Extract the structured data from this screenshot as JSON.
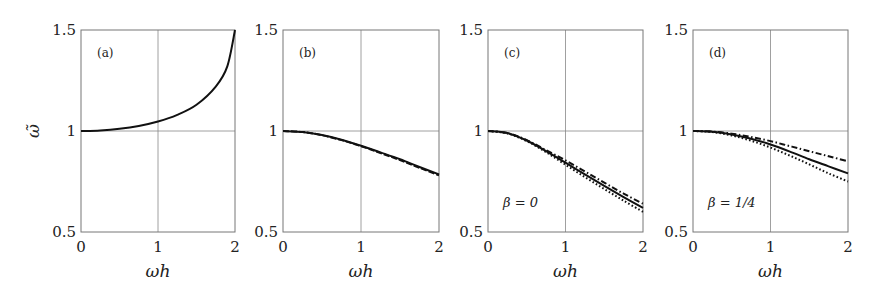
{
  "chart_data": [
    {
      "type": "line",
      "panel_label": "(a)",
      "xlabel": "ωh",
      "ylabel": "ω̃",
      "xlim": [
        0,
        2
      ],
      "ylim": [
        0.5,
        1.5
      ],
      "xticks": [
        "0",
        "1",
        "2"
      ],
      "yticks": [
        "0.5",
        "1",
        "1.5"
      ],
      "grid": true,
      "annotation": "",
      "x": [
        0,
        0.25,
        0.5,
        0.75,
        1.0,
        1.25,
        1.5,
        1.75,
        1.9,
        2.0
      ],
      "series": [
        {
          "name": "solid",
          "style": "solid",
          "values": [
            1.0,
            1.003,
            1.011,
            1.025,
            1.047,
            1.08,
            1.13,
            1.22,
            1.32,
            1.5
          ]
        }
      ]
    },
    {
      "type": "line",
      "panel_label": "(b)",
      "xlabel": "ωh",
      "ylabel": "",
      "xlim": [
        0,
        2
      ],
      "ylim": [
        0.5,
        1.5
      ],
      "xticks": [
        "0",
        "1",
        "2"
      ],
      "yticks": [
        "0.5",
        "1",
        "1.5"
      ],
      "grid": true,
      "annotation": "",
      "x": [
        0,
        0.25,
        0.5,
        0.75,
        1.0,
        1.25,
        1.5,
        1.75,
        2.0
      ],
      "series": [
        {
          "name": "solid",
          "style": "solid",
          "values": [
            1.0,
            0.995,
            0.98,
            0.957,
            0.927,
            0.894,
            0.86,
            0.822,
            0.785
          ]
        },
        {
          "name": "dashed",
          "style": "dashed",
          "values": [
            1.0,
            0.995,
            0.979,
            0.955,
            0.925,
            0.891,
            0.856,
            0.818,
            0.78
          ]
        }
      ]
    },
    {
      "type": "line",
      "panel_label": "(c)",
      "xlabel": "ωh",
      "ylabel": "",
      "xlim": [
        0,
        2
      ],
      "ylim": [
        0.5,
        1.5
      ],
      "xticks": [
        "0",
        "1",
        "2"
      ],
      "yticks": [
        "0.5",
        "1",
        "1.5"
      ],
      "grid": true,
      "annotation": "β = 0",
      "x": [
        0,
        0.25,
        0.5,
        0.75,
        1.0,
        1.25,
        1.5,
        1.75,
        2.0
      ],
      "series": [
        {
          "name": "dash-dot",
          "style": "dashdot",
          "values": [
            1.0,
            0.99,
            0.955,
            0.905,
            0.855,
            0.8,
            0.745,
            0.69,
            0.64
          ]
        },
        {
          "name": "solid",
          "style": "solid",
          "values": [
            1.0,
            0.99,
            0.953,
            0.9,
            0.843,
            0.785,
            0.728,
            0.673,
            0.62
          ]
        },
        {
          "name": "dotted",
          "style": "dotted",
          "values": [
            1.0,
            0.988,
            0.95,
            0.895,
            0.833,
            0.772,
            0.713,
            0.655,
            0.6
          ]
        }
      ]
    },
    {
      "type": "line",
      "panel_label": "(d)",
      "xlabel": "ωh",
      "ylabel": "",
      "xlim": [
        0,
        2
      ],
      "ylim": [
        0.5,
        1.5
      ],
      "xticks": [
        "0",
        "1",
        "2"
      ],
      "yticks": [
        "0.5",
        "1",
        "1.5"
      ],
      "grid": true,
      "annotation": "β = 1/4",
      "x": [
        0,
        0.25,
        0.5,
        0.75,
        1.0,
        1.25,
        1.5,
        1.75,
        2.0
      ],
      "series": [
        {
          "name": "dash-dot",
          "style": "dashdot",
          "values": [
            1.0,
            0.997,
            0.987,
            0.97,
            0.95,
            0.925,
            0.9,
            0.875,
            0.85
          ]
        },
        {
          "name": "solid",
          "style": "solid",
          "values": [
            1.0,
            0.996,
            0.983,
            0.962,
            0.933,
            0.898,
            0.86,
            0.825,
            0.79
          ]
        },
        {
          "name": "dotted",
          "style": "dotted",
          "values": [
            1.0,
            0.995,
            0.978,
            0.952,
            0.918,
            0.878,
            0.835,
            0.79,
            0.75
          ]
        }
      ]
    }
  ],
  "figure": {
    "panels": [
      {
        "left": 81,
        "right": 235,
        "top": 30,
        "bottom": 232
      },
      {
        "left": 283,
        "right": 439,
        "top": 30,
        "bottom": 232
      },
      {
        "left": 488,
        "right": 643,
        "top": 30,
        "bottom": 232
      },
      {
        "left": 693,
        "right": 848,
        "top": 30,
        "bottom": 232
      }
    ],
    "line_color": "#111111"
  }
}
